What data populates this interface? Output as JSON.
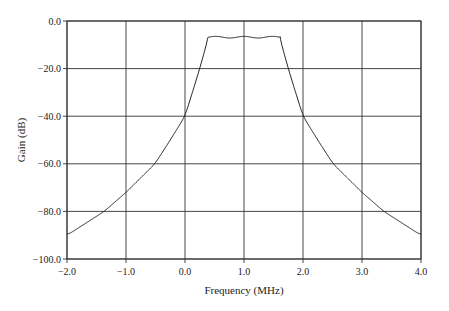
{
  "chart_data": {
    "type": "line",
    "title": "",
    "xlabel": "Frequency (MHz)",
    "ylabel": "Gain (dB)",
    "xlim": [
      -2.0,
      4.0
    ],
    "ylim": [
      -100.0,
      0.0
    ],
    "grid": true,
    "legend": null,
    "x_ticks": [
      "-2.0",
      "-1.0",
      "0.0",
      "1.0",
      "2.0",
      "3.0",
      "4.0"
    ],
    "y_ticks": [
      "0.0",
      "-20.0",
      "-40.0",
      "-60.0",
      "-80.0",
      "-100.0"
    ],
    "series": [
      {
        "name": "Bandpass filter response",
        "x": [
          -2.0,
          -1.5,
          -1.37,
          -1.0,
          -0.51,
          0.0,
          0.25,
          0.39,
          0.5,
          0.65,
          0.8,
          1.0,
          1.2,
          1.35,
          1.5,
          1.61,
          1.75,
          2.0,
          2.51,
          3.0,
          3.37,
          3.5,
          4.0
        ],
        "values": [
          -90,
          -82,
          -80,
          -72,
          -60,
          -40,
          -20,
          -6.5,
          -7.0,
          -6.6,
          -7.0,
          -6.6,
          -7.0,
          -6.6,
          -7.0,
          -6.5,
          -20,
          -40,
          -60,
          -72,
          -80,
          -82,
          -90
        ]
      }
    ]
  },
  "axes": {
    "xlabel": "Frequency (MHz)",
    "ylabel": "Gain (dB)"
  }
}
